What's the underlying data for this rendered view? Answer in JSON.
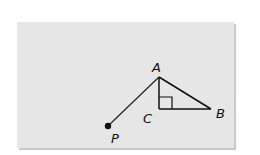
{
  "diagram": {
    "type": "geometry",
    "points": {
      "A": {
        "label": "A",
        "x": 159,
        "y": 77
      },
      "B": {
        "label": "B",
        "x": 211,
        "y": 109
      },
      "C": {
        "label": "C",
        "x": 159,
        "y": 109
      },
      "P": {
        "label": "P",
        "x": 108,
        "y": 126
      }
    },
    "segments": [
      "PA",
      "AB",
      "AC",
      "CB"
    ],
    "right_angle_at": "C",
    "colors": {
      "background": "#e6e6e6",
      "stroke": "#111111"
    }
  }
}
